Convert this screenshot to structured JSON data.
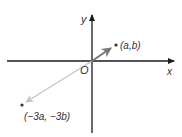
{
  "diagram": {
    "type": "coordinate-plane-vectors",
    "axes": {
      "x_label": "x",
      "y_label": "y",
      "origin_label": "O"
    },
    "points": [
      {
        "label": "(a,b)",
        "role": "vector-tip",
        "color": "#666666"
      },
      {
        "label": "(−3a, −3b)",
        "role": "scaled-vector-tip",
        "color": "#bbbbbb"
      }
    ],
    "colors": {
      "axis": "#1a1a1a",
      "vector": "#777777",
      "scaled_vector": "#c4c4c4",
      "text": "#333333"
    }
  }
}
